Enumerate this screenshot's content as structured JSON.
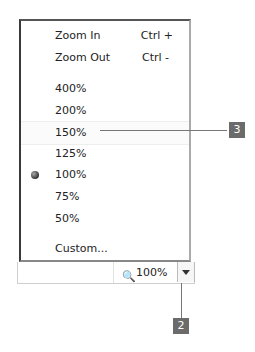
{
  "menu": {
    "items": [
      {
        "label": "Zoom In",
        "shortcut": "Ctrl +"
      },
      {
        "label": "Zoom Out",
        "shortcut": "Ctrl -"
      },
      {
        "label": "400%"
      },
      {
        "label": "200%"
      },
      {
        "label": "150%"
      },
      {
        "label": "125%"
      },
      {
        "label": "100%",
        "selected": true
      },
      {
        "label": "75%"
      },
      {
        "label": "50%"
      },
      {
        "label": "Custom..."
      }
    ]
  },
  "statusbar": {
    "zoom_icon": "magnifier-plus-icon",
    "zoom_value": "100%",
    "dropdown_icon": "chevron-down-icon"
  },
  "callouts": [
    {
      "number": "3",
      "target": "150%"
    },
    {
      "number": "2",
      "target": "zoom dropdown button"
    }
  ]
}
